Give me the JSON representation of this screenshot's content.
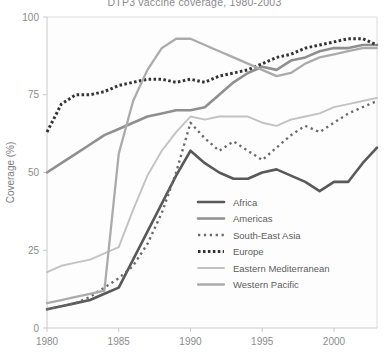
{
  "chart_data": {
    "type": "line",
    "title": "DTP3 vaccine coverage, 1980-2003",
    "xlabel": "",
    "ylabel": "Coverage (%)",
    "xlim": [
      1980,
      2003
    ],
    "ylim": [
      0,
      100
    ],
    "xticks": [
      1980,
      1985,
      1990,
      1995,
      2000
    ],
    "yticks": [
      0,
      25,
      50,
      75,
      100
    ],
    "grid": false,
    "legend_position": "inside-lower-right",
    "x": [
      1980,
      1981,
      1982,
      1983,
      1984,
      1985,
      1986,
      1987,
      1988,
      1989,
      1990,
      1991,
      1992,
      1993,
      1994,
      1995,
      1996,
      1997,
      1998,
      1999,
      2000,
      2001,
      2002,
      2003
    ],
    "series": [
      {
        "name": "Africa",
        "color": "#595959",
        "style": "solid",
        "width": 2.6,
        "values": [
          6,
          7,
          8,
          9,
          11,
          13,
          22,
          31,
          40,
          49,
          57,
          53,
          50,
          48,
          48,
          50,
          51,
          49,
          47,
          44,
          47,
          47,
          53,
          58
        ]
      },
      {
        "name": "Americas",
        "color": "#8f8f8f",
        "style": "solid",
        "width": 2.6,
        "values": [
          50,
          53,
          56,
          59,
          62,
          64,
          66,
          68,
          69,
          70,
          70,
          71,
          75,
          79,
          82,
          84,
          83,
          86,
          87,
          89,
          90,
          90,
          91,
          91
        ]
      },
      {
        "name": "South-East Asia",
        "color": "#6b6b6b",
        "style": "dotted",
        "width": 2.4,
        "values": [
          6,
          7,
          8,
          10,
          13,
          16,
          20,
          27,
          37,
          50,
          66,
          61,
          57,
          60,
          57,
          54,
          58,
          62,
          65,
          63,
          66,
          69,
          71,
          73
        ]
      },
      {
        "name": "Europe",
        "color": "#333333",
        "style": "dotted-dense",
        "width": 3.0,
        "values": [
          63,
          72,
          75,
          75,
          76,
          78,
          79,
          80,
          80,
          79,
          80,
          79,
          81,
          82,
          83,
          85,
          87,
          88,
          90,
          91,
          92,
          93,
          93,
          91
        ]
      },
      {
        "name": "Eastern Mediterranean",
        "color": "#c2c2c2",
        "style": "solid",
        "width": 1.9,
        "values": [
          18,
          20,
          21,
          22,
          24,
          26,
          38,
          49,
          57,
          63,
          68,
          67,
          68,
          68,
          68,
          66,
          65,
          67,
          68,
          69,
          71,
          72,
          73,
          74
        ]
      },
      {
        "name": "Western Pacific",
        "color": "#ababab",
        "style": "solid",
        "width": 2.3,
        "values": [
          8,
          9,
          10,
          11,
          12,
          56,
          73,
          83,
          90,
          93,
          93,
          91,
          89,
          87,
          85,
          83,
          81,
          82,
          85,
          87,
          88,
          89,
          90,
          90
        ]
      }
    ]
  },
  "axes": {
    "ylabel": "Coverage (%)",
    "yticks": [
      "0",
      "25",
      "50",
      "75",
      "100"
    ],
    "xticks": [
      "1980",
      "1985",
      "1990",
      "1995",
      "2000"
    ]
  },
  "legend": {
    "items": [
      {
        "label": "Africa"
      },
      {
        "label": "Americas"
      },
      {
        "label": "South-East Asia"
      },
      {
        "label": "Europe"
      },
      {
        "label": "Eastern Mediterranean"
      },
      {
        "label": "Western Pacific"
      }
    ]
  }
}
